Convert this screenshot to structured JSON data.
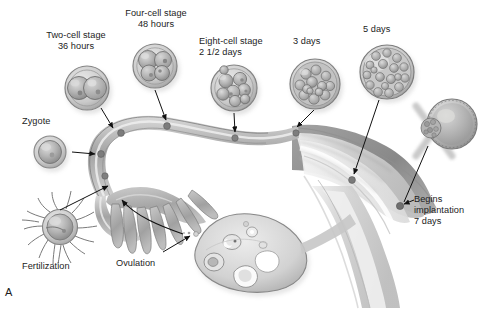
{
  "figure": {
    "panel_letter": "A",
    "palette": {
      "background": "#ffffff",
      "text": "#1c1c1c",
      "leader_line": "#111111",
      "tissue_light": "#e9e9e9",
      "tissue_mid": "#b9b9b9",
      "tissue_dark": "#8d8d8d",
      "tissue_darkest": "#6e6e6e",
      "cell_fill": "#b4b4b4",
      "cell_rim": "#6f6f6f",
      "embryo_dot": "#7a7a7a"
    }
  },
  "labels": [
    {
      "id": "two-cell-stage",
      "lines": [
        "Two-cell stage",
        "36 hours"
      ],
      "text": "Two-cell stage\n36 hours",
      "x": 24,
      "y": 30,
      "width": 104,
      "align": "center"
    },
    {
      "id": "four-cell-stage",
      "lines": [
        "Four-cell stage",
        "48 hours"
      ],
      "text": "Four-cell stage\n48 hours",
      "x": 104,
      "y": 8,
      "width": 104,
      "align": "center"
    },
    {
      "id": "eight-cell-stage",
      "lines": [
        "Eight-cell stage",
        "2 1/2 days"
      ],
      "text": "Eight-cell stage\n2 1/2 days",
      "x": 199,
      "y": 36,
      "width": 94,
      "align": "left"
    },
    {
      "id": "three-days",
      "lines": [
        "3 days"
      ],
      "text": "3 days",
      "x": 293,
      "y": 36,
      "width": 48,
      "align": "left"
    },
    {
      "id": "five-days",
      "lines": [
        "5 days"
      ],
      "text": "5 days",
      "x": 363,
      "y": 24,
      "width": 48,
      "align": "left"
    },
    {
      "id": "zygote",
      "lines": [
        "Zygote"
      ],
      "text": "Zygote",
      "x": 22,
      "y": 116,
      "width": 50,
      "align": "left"
    },
    {
      "id": "begins-implantation",
      "lines": [
        "Begins",
        "implantation",
        "7 days"
      ],
      "text": "Begins\nimplantation\n7 days",
      "x": 414,
      "y": 194,
      "width": 70,
      "align": "left"
    },
    {
      "id": "fertilization",
      "lines": [
        "Fertilization"
      ],
      "text": "Fertilization",
      "x": 22,
      "y": 261,
      "width": 64,
      "align": "left"
    },
    {
      "id": "ovulation",
      "lines": [
        "Ovulation"
      ],
      "text": "Ovulation",
      "x": 116,
      "y": 258,
      "width": 56,
      "align": "left"
    }
  ],
  "stages": [
    {
      "id": "zygote-cell",
      "name": "zygote",
      "cells": 1,
      "cx": 50,
      "cy": 152,
      "r": 16
    },
    {
      "id": "two-cell-embryo",
      "name": "two-cell stage",
      "cells": 2,
      "cx": 87,
      "cy": 88,
      "r": 22
    },
    {
      "id": "four-cell-embryo",
      "name": "four-cell stage",
      "cells": 4,
      "cx": 155,
      "cy": 66,
      "r": 22
    },
    {
      "id": "eight-cell-embryo",
      "name": "eight-cell stage",
      "cells": 8,
      "cx": 234,
      "cy": 88,
      "r": 23
    },
    {
      "id": "morula-embryo",
      "name": "morula 3 days",
      "cells": 24,
      "cx": 315,
      "cy": 84,
      "r": 25
    },
    {
      "id": "blastocyst-embryo",
      "name": "blastocyst 5 days",
      "cells": 30,
      "cx": 387,
      "cy": 72,
      "r": 27
    },
    {
      "id": "implanting-blastocyst",
      "name": "implanting blastocyst 7 days",
      "cells": 0,
      "cx": 450,
      "cy": 125,
      "r": 24
    }
  ],
  "anatomy": {
    "ovary": "ovary-with-follicles",
    "fimbriae": "fimbriae-finger-projections",
    "tube": "fallopian-tube",
    "uterus": "uterus-endometrium",
    "sperm_cell": "fertilization-oocyte-with-sperm"
  }
}
